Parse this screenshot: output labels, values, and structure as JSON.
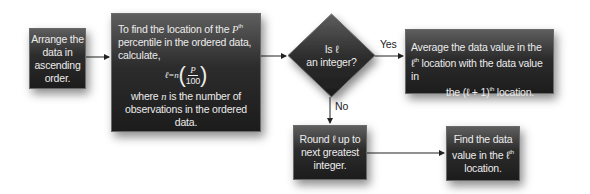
{
  "flowchart": {
    "title": "Finding the Pth percentile",
    "nodes": {
      "arrange": {
        "lines": [
          "Arrange the",
          "data in",
          "ascending",
          "order."
        ]
      },
      "compute": {
        "line1_pre": "To find the location of the ",
        "line1_var": "P",
        "line1_sup": "th",
        "line2": "percentile in the ordered data,",
        "line3": "calculate,",
        "formula_lhs": "ℓ=n",
        "formula_num": "P",
        "formula_den": "100",
        "where_pre": "where ",
        "where_var": "n",
        "where_post": " is the number of",
        "where_line2": "observations in the ordered data."
      },
      "decision": {
        "line1": "Is ℓ",
        "line2": "an integer?"
      },
      "average": {
        "line1": "Average the data value in the",
        "line2_var": "ℓ",
        "line2_sup": "th",
        "line2_post": " location with the data value in",
        "line3_pre": "the (ℓ + 1)",
        "line3_sup": "th",
        "line3_post": " location."
      },
      "round": {
        "lines": [
          "Round ℓ up to",
          "next greatest",
          "integer."
        ]
      },
      "find": {
        "line1": "Find the data",
        "line2_pre": "value in the ",
        "line2_var": "ℓ",
        "line2_sup": "th",
        "line3": "location."
      }
    },
    "edges": {
      "yes_label": "Yes",
      "no_label": "No"
    },
    "colors": {
      "box_top": "#5e5e5e",
      "box_bottom": "#1c1c1c",
      "text": "#ececec",
      "arrow": "#222222"
    }
  }
}
